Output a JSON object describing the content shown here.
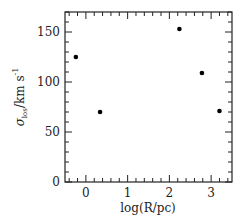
{
  "chart_data": {
    "type": "scatter",
    "title": "",
    "xlabel": "log(R/pc)",
    "ylabel": "σ_los/km s^-1",
    "ylabel_parts": {
      "sigma": "σ",
      "sub": "los",
      "rest": "/km s",
      "sup": "-1"
    },
    "xlim": [
      -0.5,
      3.5
    ],
    "ylim": [
      0,
      170
    ],
    "xticks": [
      0,
      1,
      2,
      3
    ],
    "xtick_labels": [
      "0",
      "1",
      "2",
      "3"
    ],
    "xminor_step": 0.2,
    "yticks": [
      0,
      50,
      100,
      150
    ],
    "ytick_labels": [
      "0",
      "50",
      "100",
      "150"
    ],
    "yminor_step": 10,
    "grid": false,
    "legend": null,
    "series": [
      {
        "name": "data",
        "marker": "filled-circle",
        "color": "#000000",
        "x": [
          -0.24,
          0.34,
          2.24,
          2.78,
          3.2
        ],
        "y": [
          125,
          70,
          153,
          109,
          71
        ]
      }
    ]
  }
}
